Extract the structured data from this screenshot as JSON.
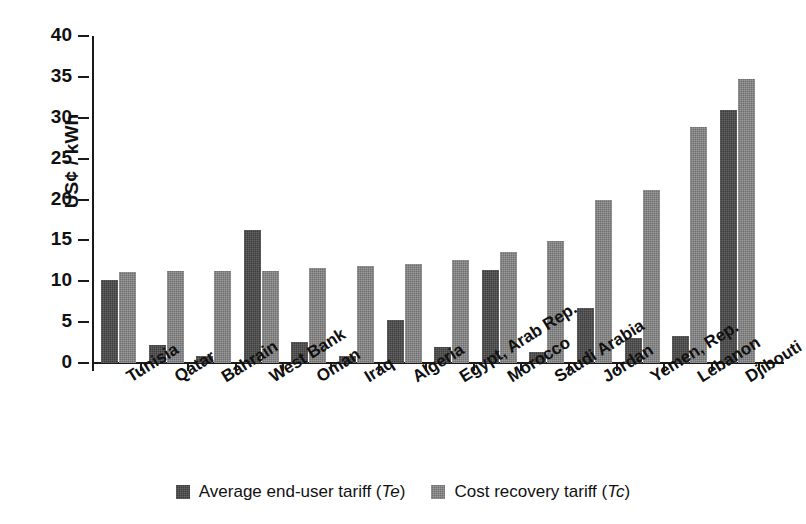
{
  "chart_data": {
    "type": "bar",
    "title": "",
    "subtitle": "",
    "xlabel": "",
    "ylabel": "US¢ / kWh",
    "ylim": [
      0,
      40
    ],
    "ytick_step": 5,
    "yticks": [
      "0",
      "5",
      "10",
      "15",
      "20",
      "25",
      "30",
      "35",
      "40"
    ],
    "grid": false,
    "legend_position": "bottom-center",
    "orientation": "vertical",
    "categories": [
      "Tunisia",
      "Qatar",
      "Bahrain",
      "West Bank",
      "Oman",
      "Iraq",
      "Algeria",
      "Egypt, Arab Rep.",
      "Morocco",
      "Saudi Arabia",
      "Jordan",
      "Yemen, Rep.",
      "Lebanon",
      "Djibouti"
    ],
    "series": [
      {
        "name": "Average end-user tariff (Te)",
        "short": "Te",
        "color": "#3d3d3d",
        "values": [
          10.1,
          2.2,
          0.8,
          16.3,
          2.6,
          0.9,
          5.3,
          1.9,
          11.4,
          1.4,
          6.7,
          3.1,
          3.3,
          31.0
        ]
      },
      {
        "name": "Cost recovery tariff (Tc)",
        "short": "Tc",
        "color": "#6f6f6f",
        "values": [
          11.1,
          11.3,
          11.3,
          11.3,
          11.6,
          11.9,
          12.1,
          12.6,
          13.6,
          14.9,
          19.9,
          21.2,
          28.9,
          34.7
        ]
      }
    ]
  },
  "legend": {
    "entries": [
      {
        "label_prefix": "Average end-user tariff (",
        "label_italic": "Te",
        "label_suffix": ")"
      },
      {
        "label_prefix": "Cost recovery tariff (",
        "label_italic": "Tc",
        "label_suffix": ")"
      }
    ]
  }
}
